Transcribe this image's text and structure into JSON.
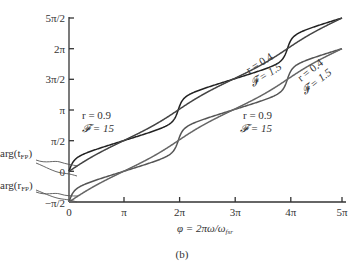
{
  "chart_data": {
    "type": "line",
    "title": "",
    "caption": "(b)",
    "xlabel": "φ = 2πω/ω_fsr",
    "ylabel": "",
    "xlim": [
      0,
      15.708
    ],
    "ylim": [
      -1.5708,
      7.854
    ],
    "grid": false,
    "x_ticks": [
      "0",
      "π",
      "2π",
      "3π",
      "4π",
      "5π"
    ],
    "y_ticks": [
      "−π/2",
      "0",
      "π/2",
      "π",
      "3π/2",
      "2π",
      "5π/2"
    ],
    "series": [
      {
        "name": "arg(t_FP), r = 0.9, F = 15",
        "group": "arg(t_FP)",
        "r": 0.9,
        "F": 15,
        "offset": 0,
        "description": "staircase from 0 to 5π/2, steep steps at π, 3π"
      },
      {
        "name": "arg(t_FP), r = 0.4, F = 1.5",
        "group": "arg(t_FP)",
        "r": 0.4,
        "F": 1.5,
        "offset": 0,
        "description": "gently wavy rise from 0 to 5π/2"
      },
      {
        "name": "arg(r_FP), r = 0.9, F = 15",
        "group": "arg(r_FP)",
        "r": 0.9,
        "F": 15,
        "offset": -1.5708,
        "description": "staircase from −π/2 to 2π"
      },
      {
        "name": "arg(r_FP), r = 0.4, F = 1.5",
        "group": "arg(r_FP)",
        "r": 0.4,
        "F": 1.5,
        "offset": -1.5708,
        "description": "gently wavy rise from −π/2 to 2π"
      }
    ],
    "annotations": [
      {
        "text": "r = 0.9",
        "sub": "𝓕 = 15",
        "position": "left, above π/2"
      },
      {
        "text": "r = 0.4",
        "sub": "𝓕 = 1.5",
        "position": "upper right, rotated"
      },
      {
        "text": "r = 0.4",
        "sub": "𝓕 = 1.5",
        "position": "right, rotated"
      },
      {
        "text": "r = 0.9",
        "sub": "𝓕 = 15",
        "position": "center right, below curves"
      },
      {
        "text": "arg(t_FP)",
        "position": "left axis, near 0..π/2"
      },
      {
        "text": "arg(r_FP)",
        "position": "left axis, near −π/2..0"
      }
    ]
  },
  "labels": {
    "xlabel": "φ = 2πω/ω",
    "xlabel_sub": "fsr",
    "caption": "(b)",
    "x_ticks": [
      "0",
      "π",
      "2π",
      "3π",
      "4π",
      "5π"
    ],
    "y_ticks": [
      "−π/2",
      "0",
      "π/2",
      "π",
      "3π/2",
      "2π",
      "5π/2"
    ],
    "ann_r09_a": "r = 0.9",
    "ann_F15_a": "𝓕 = 15",
    "ann_r04_a": "r = 0.4",
    "ann_F15b_a": "𝓕 = 1.5",
    "ann_r04_b": "r = 0.4",
    "ann_F15b_b": "𝓕 = 1.5",
    "ann_r09_b": "r = 0.9",
    "ann_F15_b": "𝓕 = 15",
    "arg_t": "arg(t",
    "arg_t_sub": "FP",
    "arg_r": "arg(r",
    "arg_r_sub": "FP",
    "close_paren": ")"
  }
}
